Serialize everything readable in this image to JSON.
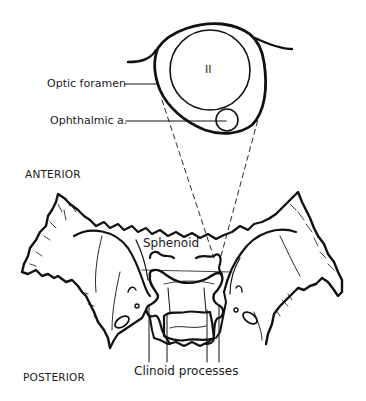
{
  "diagram": {
    "type": "anatomical-illustration",
    "colors": {
      "ink": "#111111",
      "background": "#ffffff"
    }
  },
  "inset": {
    "nerve_label": "II",
    "labels": {
      "optic_foramen": "Optic foramen",
      "ophthalmic_artery": "Ophthalmic a."
    }
  },
  "orientation": {
    "anterior": "ANTERIOR",
    "posterior": "POSTERIOR"
  },
  "bone": {
    "sphenoid_label": "Sphenoid",
    "clinoid_label": "Clinoid processes"
  }
}
